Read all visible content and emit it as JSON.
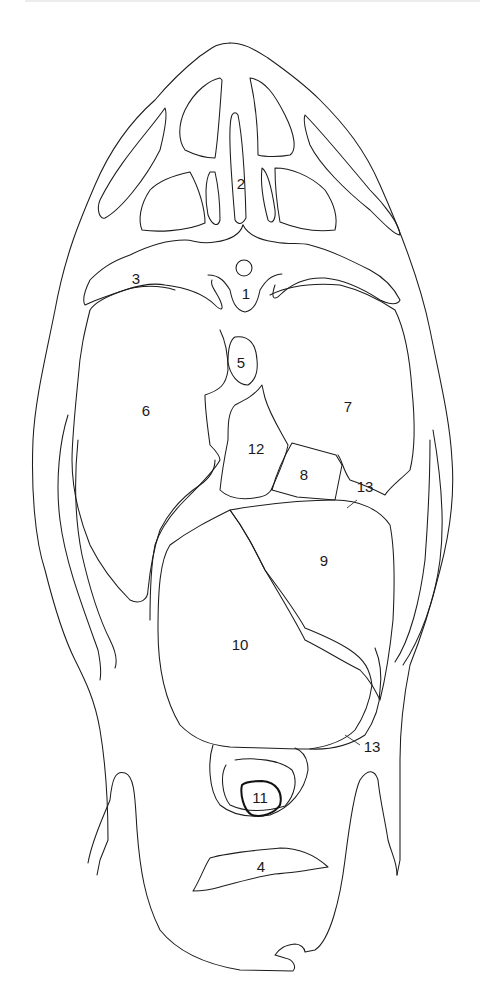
{
  "figure": {
    "type": "cross-section line drawing",
    "background_color": "#ffffff",
    "line_color": "#1c1c1c"
  },
  "labels": [
    {
      "id": "1",
      "text": "1",
      "x": 246,
      "y": 293
    },
    {
      "id": "2",
      "text": "2",
      "x": 241,
      "y": 183
    },
    {
      "id": "3",
      "text": "3",
      "x": 136,
      "y": 278
    },
    {
      "id": "4",
      "text": "4",
      "x": 261,
      "y": 866
    },
    {
      "id": "5",
      "text": "5",
      "x": 241,
      "y": 362
    },
    {
      "id": "6",
      "text": "6",
      "x": 146,
      "y": 410
    },
    {
      "id": "7",
      "text": "7",
      "x": 348,
      "y": 406
    },
    {
      "id": "8",
      "text": "8",
      "x": 304,
      "y": 474
    },
    {
      "id": "9",
      "text": "9",
      "x": 324,
      "y": 560
    },
    {
      "id": "10",
      "text": "10",
      "x": 240,
      "y": 644
    },
    {
      "id": "11",
      "text": "11",
      "x": 260,
      "y": 797
    },
    {
      "id": "12",
      "text": "12",
      "x": 256,
      "y": 448
    },
    {
      "id": "13a",
      "text": "13",
      "x": 365,
      "y": 486
    },
    {
      "id": "13b",
      "text": "13",
      "x": 372,
      "y": 746
    }
  ]
}
